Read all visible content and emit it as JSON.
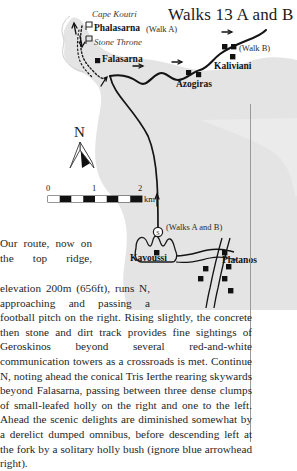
{
  "page": {
    "title": "Walks 13 A and B"
  },
  "map": {
    "labels": {
      "cape_koutri": "Cape Koutri",
      "phalasarna": "Phalasarna",
      "walk_a": "(Walk A)",
      "stone_throne": "Stone Throne",
      "falasarna": "Falasarna",
      "azogiras": "Azogiras",
      "kaliviani": "Kaliviani",
      "walk_b": "(Walk B)",
      "kavoussi": "Kavoussi",
      "platanos": "Platanos",
      "walks_a_and_b": "(Walks A and B)"
    },
    "compass": {
      "north": "N"
    },
    "scale": {
      "ticks": [
        "0",
        "1",
        "2"
      ],
      "unit": "km"
    },
    "colors": {
      "land": "#e4e4e4",
      "sea": "#ffffff",
      "road": "#1a1a1a",
      "settlement": "#111111"
    }
  },
  "body": {
    "paragraph": "Our route, now on the top ridge, elevation 200m (656ft), runs N, approaching and passing a football pitch on the right. Rising slightly, the concrete then stone and dirt track provides fine sightings of Geroskinos beyond several red-and-white communication towers as a crossroads is met. Continue N, noting ahead the conical Tris Ierthe rearing skywards beyond Falasarna, passing between three dense clumps of small-leafed holly on the right and one to the left. Ahead the scenic delights are diminished somewhat by a derelict dumped omnibus, before descending left at the fork by a solitary holly bush (ignore blue arrowhead right)."
  }
}
